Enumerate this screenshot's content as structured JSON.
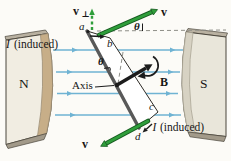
{
  "figure_type": "generator-induction-diagram",
  "colors": {
    "background": "#fcfbf7",
    "field_line_blue": "#6fb3d3",
    "arrow_green": "#2f9e3b",
    "arrow_green_dark": "#15591f",
    "pole_face_tan": "#c7ae88",
    "pole_body_light": "#f1ede2",
    "pole_body_gray": "#e9e6da",
    "bevel_gray": "#b9b1a1",
    "shadow_gray": "#a29a8a",
    "outline": "#4b463c",
    "ink_black": "#1c1c1c",
    "dash_gray": "#8f8f88",
    "loop_edge_thick": "#595959"
  },
  "labels": {
    "pole_left": "N",
    "pole_right": "S",
    "field": "B",
    "axis": "Axis",
    "theta_top": "θ",
    "theta_middle": "θ",
    "velocity_top": "v",
    "velocity_bottom": "v",
    "v_perp_main": "v",
    "v_perp_sub": "⊥",
    "corner_a": "a",
    "corner_b": "b",
    "corner_c": "c",
    "corner_d": "d",
    "induced_top": {
      "symbol": "I",
      "note": "(induced)"
    },
    "induced_bottom": {
      "symbol": "I",
      "note": "(induced)"
    }
  }
}
